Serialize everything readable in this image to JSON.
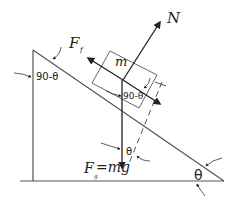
{
  "diagram": {
    "labels": {
      "normal_force": "N",
      "friction_force": "F",
      "friction_subscript": "f",
      "mass": "m",
      "gravity_F": "F",
      "gravity_subscript": "g",
      "gravity_eq": "=mg",
      "angle_top": "90-θ",
      "angle_block": "90-θ",
      "angle_gravity": "θ",
      "angle_base": "θ"
    },
    "colors": {
      "stroke": "#555555",
      "arrow": "#222222",
      "text": "#222222",
      "background": "#ffffff"
    }
  }
}
